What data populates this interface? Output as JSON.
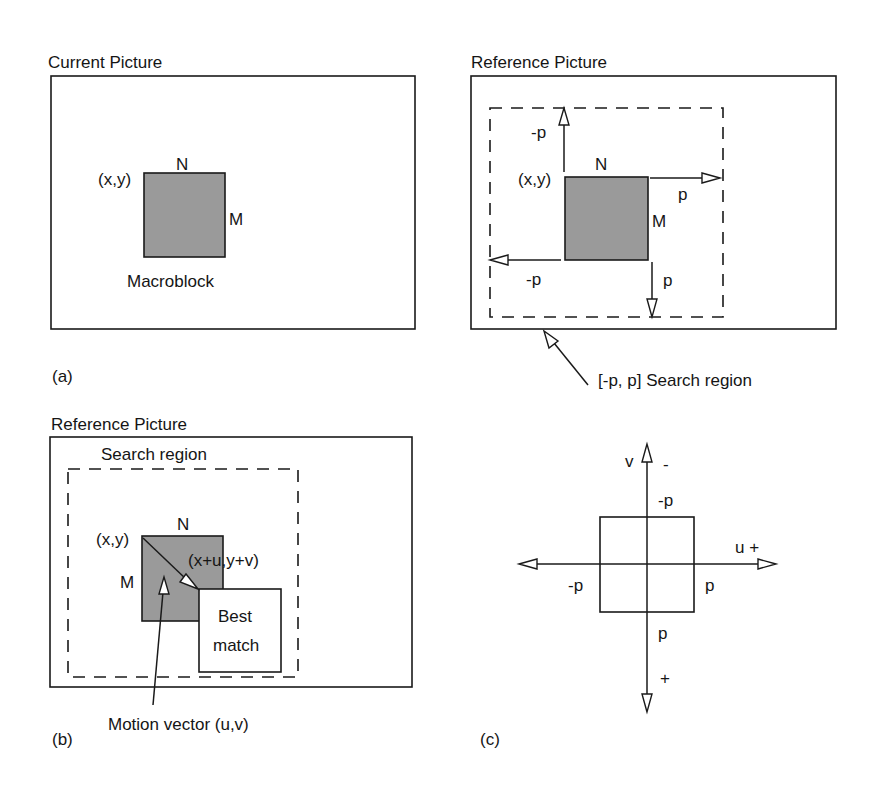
{
  "figure": {
    "panel_a": {
      "caption": "(a)",
      "picture_title": "Current Picture",
      "block_origin": "(x,y)",
      "width_label": "N",
      "height_label": "M",
      "block_label": "Macroblock"
    },
    "panel_a_right": {
      "picture_title": "Reference Picture",
      "block_origin": "(x,y)",
      "width_label": "N",
      "height_label": "M",
      "up_label": "-p",
      "right_label": "p",
      "left_label": "-p",
      "down_label": "p",
      "search_region_callout": "[-p, p] Search region"
    },
    "panel_b": {
      "caption": "(b)",
      "picture_title": "Reference Picture",
      "search_region_label": "Search region",
      "block_origin": "(x,y)",
      "width_label": "N",
      "height_label": "M",
      "displaced_origin": "(x+u,y+v)",
      "best_match_line1": "Best",
      "best_match_line2": "match",
      "motion_vector_label": "Motion vector (u,v)"
    },
    "panel_c": {
      "caption": "(c)",
      "v_axis_label": "v",
      "v_negative_sign": "-",
      "v_positive_sign": "+",
      "u_axis_label": "u +",
      "top_label": "-p",
      "left_label": "-p",
      "right_label": "p",
      "bottom_label": "p"
    },
    "colors": {
      "stroke": "#1a1a1a",
      "macroblock_fill": "#9a9a9a",
      "background": "#ffffff"
    }
  }
}
